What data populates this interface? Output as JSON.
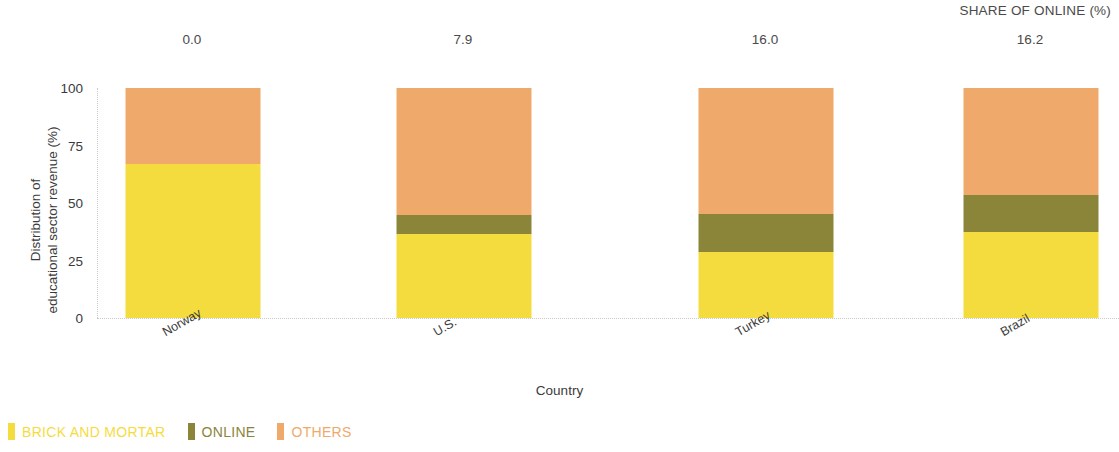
{
  "header": {
    "share_title": "SHARE OF ONLINE (%)"
  },
  "axes": {
    "ylabel_line1": "Distribution of",
    "ylabel_line2": "educational sector revenue (%)",
    "xlabel": "Country",
    "yticks": [
      "100",
      "75",
      "50",
      "25",
      "0"
    ]
  },
  "legend": {
    "items": [
      {
        "label": "BRICK AND MORTAR",
        "color": "#F5DC3E"
      },
      {
        "label": "ONLINE",
        "color": "#8A8538"
      },
      {
        "label": "OTHERS",
        "color": "#EFA96B"
      }
    ]
  },
  "chart_data": {
    "type": "bar",
    "title": "",
    "subtitle": "",
    "xlabel": "Country",
    "ylabel": "Distribution of educational sector revenue (%)",
    "ylim": [
      0,
      100
    ],
    "yticks": [
      0,
      25,
      50,
      75,
      100
    ],
    "stacked": true,
    "grid": false,
    "legend_position": "bottom-left",
    "categories": [
      "Norway",
      "U.S.",
      "Turkey",
      "Brazil"
    ],
    "series": [
      {
        "name": "BRICK AND MORTAR",
        "color": "#F5DC3E",
        "values": [
          67.0,
          36.5,
          28.7,
          37.4
        ]
      },
      {
        "name": "ONLINE",
        "color": "#8A8538",
        "values": [
          0.0,
          8.3,
          16.5,
          16.1
        ]
      },
      {
        "name": "OTHERS",
        "color": "#EFA96B",
        "values": [
          33.0,
          55.2,
          54.8,
          46.5
        ]
      }
    ],
    "annotations": {
      "label": "SHARE OF ONLINE (%)",
      "values": [
        "0.0",
        "7.9",
        "16.0",
        "16.2"
      ]
    }
  }
}
